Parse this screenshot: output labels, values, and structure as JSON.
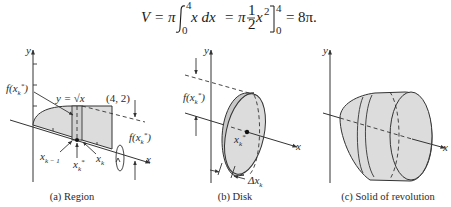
{
  "equation": {
    "lhs": "V",
    "eq1": "=",
    "pi1": "π",
    "integral_upper": "4",
    "integral_lower": "0",
    "integrand": "x dx",
    "eq2": "=",
    "pi2": "π",
    "frac_num": "1",
    "frac_den": "2",
    "x_term": "x",
    "x_exp": "2",
    "eval_upper": "4",
    "eval_lower": "0",
    "eq3": "=",
    "result": "8π."
  },
  "panels": {
    "region": {
      "caption": "(a) Region",
      "y_axis_label": "y",
      "x_axis_label": "x",
      "curve_label": "y = √x",
      "point_label": "(4, 2)",
      "height_label_left": "f(x",
      "height_label_right": "f(x",
      "sub_k_star": "k",
      "star": "*",
      "close_paren": ")",
      "x_k_minus_1": "x",
      "x_k_minus_1_sub": "k − 1",
      "x_k_star": "x",
      "x_k": "x",
      "x_k_sub": "k"
    },
    "disk": {
      "caption": "(b) Disk",
      "y_axis_label": "y",
      "x_axis_label": "x",
      "height_label": "f(x",
      "center_label": "x",
      "delta_label": "Δx",
      "delta_sub": "k"
    },
    "solid": {
      "caption": "(c) Solid of revolution",
      "y_axis_label": "y",
      "x_axis_label": "x"
    }
  },
  "colors": {
    "shade": "#dcdcdc",
    "line": "#333333",
    "background": "#ffffff"
  }
}
